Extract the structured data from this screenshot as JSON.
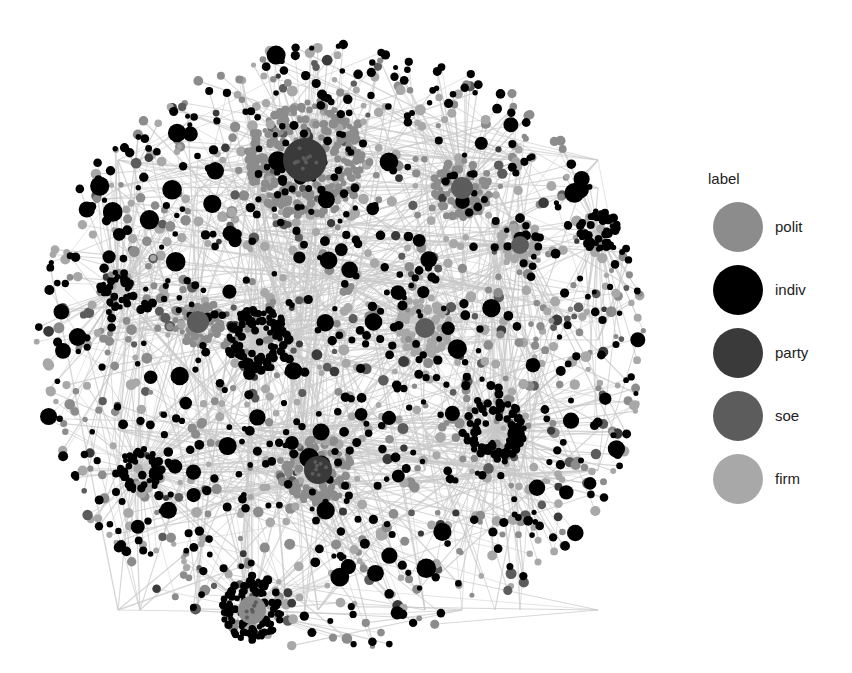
{
  "legend": {
    "title": "label",
    "items": [
      {
        "key": "polit",
        "label": "polit",
        "color": "#8c8c8c"
      },
      {
        "key": "indiv",
        "label": "indiv",
        "color": "#000000"
      },
      {
        "key": "party",
        "label": "party",
        "color": "#3a3a3a"
      },
      {
        "key": "soe",
        "label": "soe",
        "color": "#5c5c5c"
      },
      {
        "key": "firm",
        "label": "firm",
        "color": "#a8a8a8"
      }
    ]
  },
  "graph": {
    "edge_color": "#c8c8c8",
    "center": [
      340,
      345
    ],
    "radius": 305,
    "hubs": [
      {
        "x": 305,
        "y": 160,
        "r": 58,
        "core": "party",
        "core_r": 22,
        "ring": "polit",
        "n": 260
      },
      {
        "x": 462,
        "y": 188,
        "r": 30,
        "core": "soe",
        "core_r": 11,
        "ring": "polit",
        "n": 90
      },
      {
        "x": 520,
        "y": 245,
        "r": 22,
        "core": "soe",
        "core_r": 9,
        "ring": "firm",
        "n": 50
      },
      {
        "x": 598,
        "y": 230,
        "r": 20,
        "core": "firm",
        "core_r": 0,
        "ring": "indiv",
        "n": 60
      },
      {
        "x": 425,
        "y": 328,
        "r": 28,
        "core": "soe",
        "core_r": 10,
        "ring": "firm",
        "n": 80
      },
      {
        "x": 198,
        "y": 322,
        "r": 24,
        "core": "soe",
        "core_r": 11,
        "ring": "polit",
        "n": 60
      },
      {
        "x": 258,
        "y": 340,
        "r": 32,
        "core": "indiv",
        "core_r": 0,
        "ring": "indiv",
        "n": 110
      },
      {
        "x": 318,
        "y": 470,
        "r": 34,
        "core": "party",
        "core_r": 14,
        "ring": "polit",
        "n": 110
      },
      {
        "x": 252,
        "y": 610,
        "r": 30,
        "core": "polit",
        "core_r": 14,
        "ring": "indiv",
        "n": 95
      },
      {
        "x": 118,
        "y": 290,
        "r": 18,
        "core": "polit",
        "core_r": 0,
        "ring": "indiv",
        "n": 40
      },
      {
        "x": 495,
        "y": 430,
        "r": 30,
        "core": "indiv",
        "core_r": 0,
        "ring": "indiv",
        "n": 90
      },
      {
        "x": 140,
        "y": 470,
        "r": 22,
        "core": "firm",
        "core_r": 0,
        "ring": "indiv",
        "n": 45
      }
    ],
    "total_scatter_nodes": 1400,
    "seed": 17
  }
}
